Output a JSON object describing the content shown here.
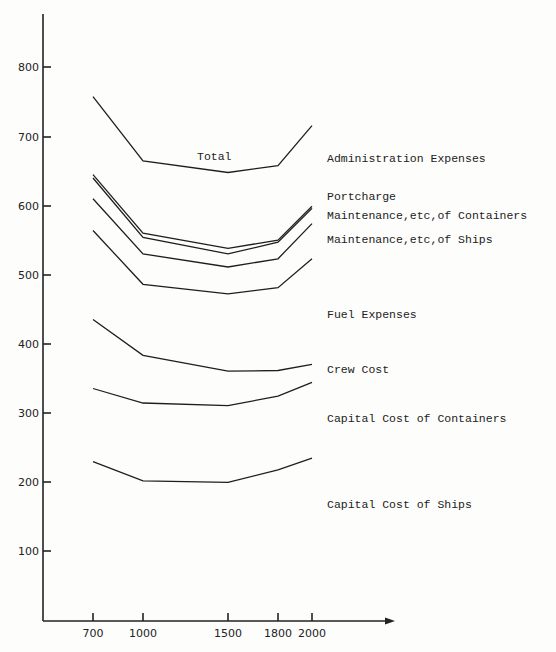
{
  "chart_data": {
    "type": "line",
    "title": "",
    "xlabel": "",
    "ylabel": "",
    "x": [
      700,
      1000,
      1500,
      1800,
      2000
    ],
    "x_tick_labels": [
      "700",
      "1000",
      "1500",
      "1800",
      "2000"
    ],
    "y_tick_labels": [
      "100",
      "200",
      "300",
      "400",
      "500",
      "600",
      "700",
      "800"
    ],
    "ylim": [
      0,
      850
    ],
    "grid": false,
    "legend_position": "right, inline labels",
    "annotations": [
      "Total"
    ],
    "series": [
      {
        "name": "Total / Administration Expenses",
        "values": [
          760,
          667,
          650,
          660,
          718
        ]
      },
      {
        "name": "Portcharge",
        "values": [
          647,
          562,
          540,
          552,
          601
        ]
      },
      {
        "name": "Maintenance,etc,of Containers",
        "values": [
          642,
          556,
          532,
          549,
          598
        ]
      },
      {
        "name": "Maintenance,etc,of Ships",
        "values": [
          612,
          532,
          513,
          525,
          576
        ]
      },
      {
        "name": "Fuel Expenses",
        "values": [
          566,
          488,
          474,
          483,
          525
        ]
      },
      {
        "name": "Crew Cost",
        "values": [
          437,
          385,
          362,
          363,
          372
        ]
      },
      {
        "name": "Capital Cost of Containers",
        "values": [
          337,
          316,
          312,
          326,
          346
        ]
      },
      {
        "name": "Capital Cost of Ships",
        "values": [
          231,
          203,
          201,
          219,
          236
        ]
      }
    ]
  },
  "labels": {
    "total": "Total",
    "admin": "Administration Expenses",
    "portcharge": "Portcharge",
    "maint_containers": "Maintenance,etc,of Containers",
    "maint_ships": "Maintenance,etc,of Ships",
    "fuel": "Fuel Expenses",
    "crew": "Crew Cost",
    "cap_containers": "Capital Cost of Containers",
    "cap_ships": "Capital Cost of Ships"
  },
  "axes": {
    "y": [
      "100",
      "200",
      "300",
      "400",
      "500",
      "600",
      "700",
      "800"
    ],
    "x": [
      "700",
      "1000",
      "1500",
      "1800",
      "2000"
    ]
  }
}
